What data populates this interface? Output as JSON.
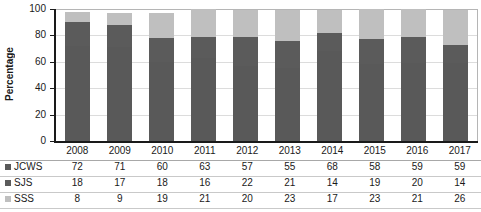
{
  "chart_data": {
    "type": "bar",
    "subtype": "stacked-column-100",
    "title": "",
    "xlabel": "",
    "ylabel": "Percentage",
    "ylim": [
      0,
      100
    ],
    "yticks": [
      0,
      20,
      40,
      60,
      80,
      100
    ],
    "grid": true,
    "legend_position": "table-left",
    "categories": [
      "2008",
      "2009",
      "2010",
      "2011",
      "2012",
      "2013",
      "2014",
      "2015",
      "2016",
      "2017"
    ],
    "series": [
      {
        "name": "JCWS",
        "color": "#595959",
        "values": [
          72,
          71,
          60,
          63,
          57,
          55,
          68,
          58,
          59,
          59
        ]
      },
      {
        "name": "SJS",
        "color": "#5b5b5b",
        "values": [
          18,
          17,
          18,
          16,
          22,
          21,
          14,
          19,
          20,
          14
        ]
      },
      {
        "name": "SSS",
        "color": "#bfbfbf",
        "values": [
          8,
          9,
          19,
          21,
          20,
          23,
          17,
          23,
          21,
          26
        ]
      }
    ]
  },
  "axis": {
    "y_label": "Percentage",
    "y_tick_labels": [
      "100",
      "80",
      "60",
      "40",
      "20",
      "0"
    ]
  },
  "table": {
    "header": [
      "2008",
      "2009",
      "2010",
      "2011",
      "2012",
      "2013",
      "2014",
      "2015",
      "2016",
      "2017"
    ],
    "rows": [
      {
        "label": "JCWS",
        "swatch": "series-swatch-jcws",
        "values": [
          "72",
          "71",
          "60",
          "63",
          "57",
          "55",
          "68",
          "58",
          "59",
          "59"
        ]
      },
      {
        "label": "SJS",
        "swatch": "series-swatch-sjs",
        "values": [
          "18",
          "17",
          "18",
          "16",
          "22",
          "21",
          "14",
          "19",
          "20",
          "14"
        ]
      },
      {
        "label": "SSS",
        "swatch": "series-swatch-sss",
        "values": [
          "8",
          "9",
          "19",
          "21",
          "20",
          "23",
          "17",
          "23",
          "21",
          "26"
        ]
      }
    ]
  },
  "colors": {
    "series_jcws": "#595959",
    "series_sjs": "#5b5b5b",
    "series_sss": "#bfbfbf",
    "axis": "#1a1a1a",
    "gridline": "#dcdcdc",
    "table_rule": "#c9c9c9"
  }
}
